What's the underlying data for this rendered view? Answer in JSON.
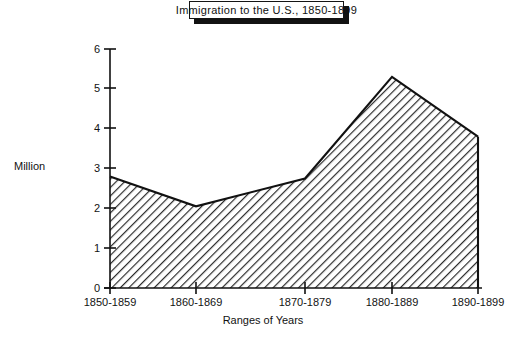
{
  "title": {
    "text": "Immigration to the U.S., 1850-1899"
  },
  "axes": {
    "ylabel": "Million",
    "xlabel": "Ranges of Years",
    "yticks": [
      "0",
      "1",
      "2",
      "3",
      "4",
      "5",
      "6"
    ],
    "xticks": [
      "1850-1859",
      "1860-1869",
      "1870-1879",
      "1880-1889",
      "1890-1899"
    ]
  },
  "colors": {
    "ink": "#121212",
    "background": "#ffffff",
    "hatch": "#2a2a2a",
    "shadow": "#121212"
  },
  "chart_data": {
    "type": "area",
    "title": "Immigration to the U.S., 1850-1899",
    "xlabel": "Ranges of Years",
    "ylabel": "Million",
    "categories": [
      "1850-1859",
      "1860-1869",
      "1870-1879",
      "1880-1889",
      "1890-1899"
    ],
    "values": [
      2.8,
      2.05,
      2.75,
      5.3,
      3.8
    ],
    "ylim": [
      0,
      6
    ],
    "yticks": [
      0,
      1,
      2,
      3,
      4,
      5,
      6
    ],
    "grid": false,
    "legend": false,
    "fill": "diagonal-hatch",
    "units": "millions of immigrants"
  }
}
